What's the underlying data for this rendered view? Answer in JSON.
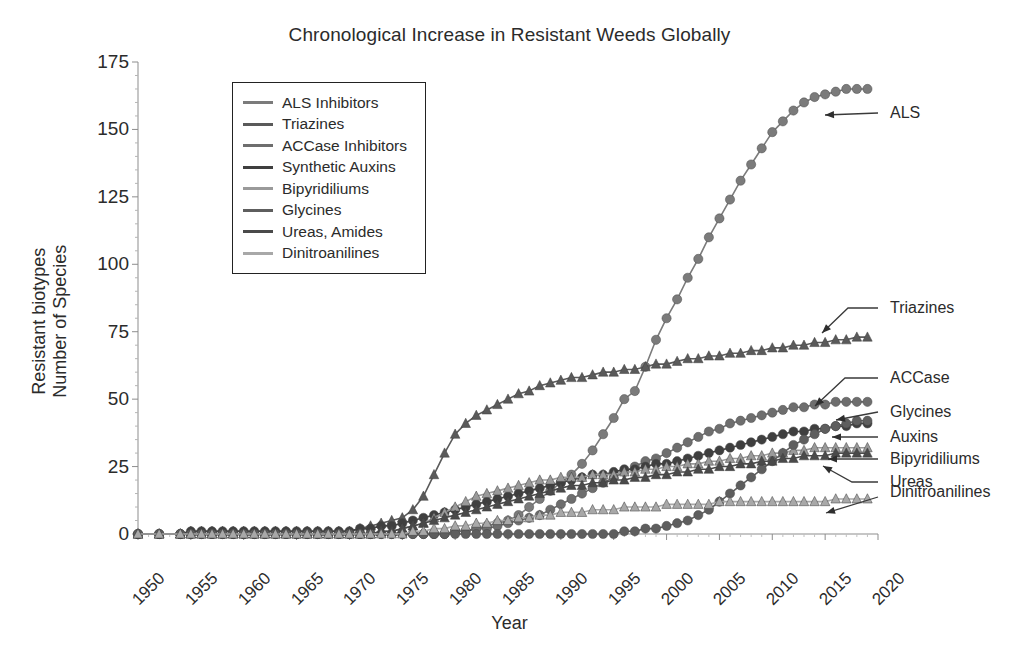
{
  "chart_data": {
    "type": "line",
    "title": "Chronological Increase in Resistant Weeds Globally",
    "xlabel": "Year",
    "ylabel": "Resistant biotypes Number of Species",
    "ylabel_lines": [
      "Resistant biotypes",
      "Number of Species"
    ],
    "xlim": [
      1950,
      2020
    ],
    "ylim": [
      0,
      175
    ],
    "xticks": [
      1950,
      1955,
      1960,
      1965,
      1970,
      1975,
      1980,
      1985,
      1990,
      1995,
      2000,
      2005,
      2010,
      2015,
      2020
    ],
    "yticks": [
      0,
      25,
      50,
      75,
      100,
      125,
      150,
      175
    ],
    "grid": false,
    "legend_position": "upper-left-inset",
    "x": [
      1950,
      1952,
      1954,
      1955,
      1956,
      1957,
      1958,
      1959,
      1960,
      1961,
      1962,
      1963,
      1964,
      1965,
      1966,
      1967,
      1968,
      1969,
      1970,
      1971,
      1972,
      1973,
      1974,
      1975,
      1976,
      1977,
      1978,
      1979,
      1980,
      1981,
      1982,
      1983,
      1984,
      1985,
      1986,
      1987,
      1988,
      1989,
      1990,
      1991,
      1992,
      1993,
      1994,
      1995,
      1996,
      1997,
      1998,
      1999,
      2000,
      2001,
      2002,
      2003,
      2004,
      2005,
      2006,
      2007,
      2008,
      2009,
      2010,
      2011,
      2012,
      2013,
      2014,
      2015,
      2016,
      2017,
      2018,
      2019
    ],
    "series": [
      {
        "name": "ALS Inhibitors",
        "label": "ALS",
        "marker": "circle",
        "color": "#7b7b7b",
        "values": [
          0,
          0,
          0,
          0,
          0,
          0,
          0,
          0,
          0,
          0,
          0,
          0,
          0,
          0,
          0,
          0,
          0,
          0,
          0,
          0,
          0,
          0,
          0,
          0,
          0,
          0,
          0,
          0,
          1,
          1,
          2,
          3,
          4,
          5,
          7,
          10,
          13,
          16,
          19,
          22,
          26,
          31,
          37,
          43,
          50,
          53,
          62,
          72,
          80,
          87,
          95,
          102,
          110,
          117,
          124,
          131,
          137,
          143,
          149,
          153,
          157,
          160,
          162,
          163,
          164,
          165,
          165,
          165
        ]
      },
      {
        "name": "Triazines",
        "label": "Triazines",
        "marker": "triangle",
        "color": "#5a5a5a",
        "values": [
          0,
          0,
          0,
          1,
          1,
          1,
          1,
          1,
          1,
          1,
          1,
          1,
          1,
          1,
          1,
          1,
          1,
          1,
          1,
          2,
          3,
          4,
          5,
          6,
          9,
          14,
          22,
          30,
          37,
          41,
          44,
          46,
          48,
          50,
          52,
          53,
          55,
          56,
          57,
          58,
          58,
          59,
          60,
          60,
          61,
          61,
          62,
          63,
          63,
          64,
          65,
          65,
          66,
          66,
          67,
          67,
          68,
          68,
          69,
          69,
          70,
          70,
          71,
          71,
          72,
          72,
          73,
          73
        ]
      },
      {
        "name": "ACCase Inhibitors",
        "label": "ACCase",
        "marker": "circle",
        "color": "#6e6e6e",
        "values": [
          0,
          0,
          0,
          0,
          0,
          0,
          0,
          0,
          0,
          0,
          0,
          0,
          0,
          0,
          0,
          0,
          0,
          0,
          0,
          0,
          0,
          0,
          0,
          0,
          0,
          0,
          0,
          0,
          1,
          1,
          2,
          2,
          3,
          4,
          5,
          6,
          7,
          9,
          11,
          13,
          15,
          17,
          19,
          21,
          23,
          25,
          27,
          28,
          30,
          32,
          34,
          36,
          38,
          39,
          41,
          42,
          43,
          44,
          45,
          46,
          47,
          47,
          48,
          48,
          49,
          49,
          49,
          49
        ]
      },
      {
        "name": "Synthetic Auxins",
        "label": "Auxins",
        "marker": "circle",
        "color": "#3f3f3f",
        "values": [
          0,
          0,
          0,
          1,
          1,
          1,
          1,
          1,
          1,
          1,
          1,
          1,
          1,
          1,
          1,
          1,
          1,
          1,
          1,
          2,
          2,
          3,
          3,
          4,
          5,
          6,
          7,
          8,
          9,
          10,
          11,
          12,
          13,
          14,
          15,
          16,
          17,
          18,
          19,
          20,
          21,
          22,
          22,
          23,
          24,
          24,
          25,
          26,
          26,
          27,
          28,
          29,
          30,
          31,
          32,
          33,
          34,
          35,
          36,
          37,
          38,
          38,
          39,
          39,
          40,
          40,
          41,
          41
        ]
      },
      {
        "name": "Bipyridiliums",
        "label": "Bipyridiliums",
        "marker": "triangle",
        "color": "#9a9a9a",
        "values": [
          0,
          0,
          0,
          0,
          0,
          0,
          0,
          0,
          0,
          0,
          0,
          0,
          0,
          0,
          0,
          0,
          0,
          0,
          0,
          0,
          0,
          1,
          1,
          2,
          3,
          4,
          6,
          8,
          10,
          12,
          14,
          15,
          16,
          17,
          18,
          19,
          20,
          20,
          21,
          21,
          21,
          22,
          22,
          22,
          23,
          23,
          24,
          24,
          25,
          25,
          26,
          26,
          27,
          27,
          28,
          28,
          29,
          29,
          30,
          30,
          31,
          31,
          32,
          32,
          32,
          32,
          32,
          32
        ]
      },
      {
        "name": "Glycines",
        "label": "Glycines",
        "marker": "circle",
        "color": "#5e5e5e",
        "values": [
          0,
          0,
          0,
          0,
          0,
          0,
          0,
          0,
          0,
          0,
          0,
          0,
          0,
          0,
          0,
          0,
          0,
          0,
          0,
          0,
          0,
          0,
          0,
          0,
          0,
          0,
          0,
          0,
          0,
          0,
          0,
          0,
          0,
          0,
          0,
          0,
          0,
          0,
          0,
          0,
          0,
          0,
          0,
          0,
          1,
          1,
          2,
          2,
          3,
          4,
          5,
          7,
          9,
          12,
          15,
          18,
          21,
          24,
          27,
          30,
          33,
          35,
          37,
          39,
          40,
          41,
          42,
          42
        ]
      },
      {
        "name": "Ureas, Amides",
        "label": "Ureas",
        "marker": "triangle",
        "color": "#4a4a4a",
        "values": [
          0,
          0,
          0,
          0,
          0,
          0,
          0,
          0,
          0,
          0,
          0,
          0,
          0,
          0,
          0,
          0,
          0,
          0,
          0,
          0,
          0,
          1,
          1,
          2,
          3,
          4,
          5,
          6,
          7,
          8,
          9,
          10,
          11,
          12,
          13,
          14,
          15,
          16,
          17,
          18,
          18,
          19,
          19,
          20,
          20,
          21,
          21,
          22,
          22,
          23,
          23,
          24,
          24,
          25,
          25,
          26,
          26,
          27,
          27,
          28,
          28,
          29,
          29,
          29,
          30,
          30,
          30,
          30
        ]
      },
      {
        "name": "Dinitroanilines",
        "label": "Dinitroanilines",
        "marker": "triangle",
        "color": "#a8a8a8",
        "values": [
          0,
          0,
          0,
          0,
          0,
          0,
          0,
          0,
          0,
          0,
          0,
          0,
          0,
          0,
          0,
          0,
          0,
          0,
          0,
          0,
          0,
          0,
          0,
          0,
          1,
          1,
          2,
          2,
          3,
          3,
          4,
          4,
          5,
          5,
          6,
          6,
          7,
          7,
          8,
          8,
          8,
          9,
          9,
          9,
          10,
          10,
          10,
          10,
          11,
          11,
          11,
          11,
          11,
          12,
          12,
          12,
          12,
          12,
          12,
          12,
          12,
          12,
          12,
          12,
          13,
          13,
          13,
          13
        ]
      }
    ],
    "annotations": [
      {
        "label": "ALS",
        "text_x": 1940,
        "text_y": 0
      },
      {
        "label": "Triazines",
        "text_x": 0,
        "text_y": 0
      },
      {
        "label": "ACCase",
        "text_x": 0,
        "text_y": 0
      },
      {
        "label": "Glycines",
        "text_x": 0,
        "text_y": 0
      },
      {
        "label": "Auxins",
        "text_x": 0,
        "text_y": 0
      },
      {
        "label": "Bipyridiliums",
        "text_x": 0,
        "text_y": 0
      },
      {
        "label": "Ureas",
        "text_x": 0,
        "text_y": 0
      },
      {
        "label": "Dinitroanilines",
        "text_x": 0,
        "text_y": 0
      }
    ]
  },
  "annotation_layout": [
    {
      "name": "ALS",
      "tx": 890,
      "ty": 113,
      "ax": 825,
      "ay": 115,
      "ex": 878,
      "ey": 113,
      "kink": null
    },
    {
      "name": "Triazines",
      "tx": 890,
      "ty": 308,
      "ax": 822,
      "ay": 333,
      "ex": 878,
      "ey": 308,
      "kink": [
        848,
        308
      ]
    },
    {
      "name": "ACCase",
      "tx": 890,
      "ty": 378,
      "ax": 815,
      "ay": 406,
      "ex": 878,
      "ey": 378,
      "kink": [
        845,
        378
      ]
    },
    {
      "name": "Glycines",
      "tx": 890,
      "ty": 412,
      "ax": 836,
      "ay": 420,
      "ex": 878,
      "ey": 412,
      "kink": null
    },
    {
      "name": "Auxins",
      "tx": 890,
      "ty": 437,
      "ax": 832,
      "ay": 437,
      "ex": 878,
      "ey": 437,
      "kink": null
    },
    {
      "name": "Bipyridiliums",
      "tx": 890,
      "ty": 459,
      "ax": 828,
      "ay": 459,
      "ex": 878,
      "ey": 459,
      "kink": null
    },
    {
      "name": "Ureas",
      "tx": 890,
      "ty": 482,
      "ax": 823,
      "ay": 466,
      "ex": 878,
      "ey": 482,
      "kink": [
        852,
        482
      ]
    },
    {
      "name": "Dinitroanilines",
      "tx": 890,
      "ty": 492,
      "ax": 826,
      "ay": 513,
      "ex": 878,
      "ey": 497,
      "kink": null
    }
  ]
}
